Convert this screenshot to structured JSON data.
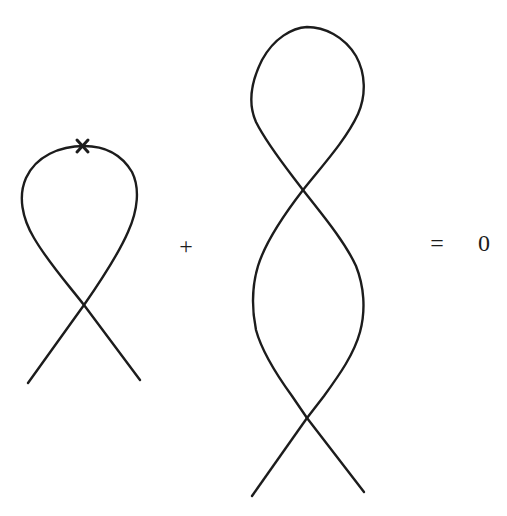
{
  "equation": {
    "operator_plus": "+",
    "operator_equals": "=",
    "result": "0"
  },
  "figures": [
    {
      "id": "single-twist-loop",
      "description": "Loop with one crossing, marked point at top",
      "crossings": 1,
      "marked_point": "x"
    },
    {
      "id": "double-twist-loop",
      "description": "Loop with two crossings",
      "crossings": 2
    }
  ],
  "colors": {
    "stroke": "#1c1c1c",
    "background": "#ffffff"
  }
}
